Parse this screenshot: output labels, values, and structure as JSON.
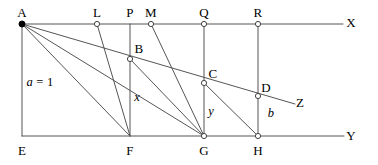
{
  "figure": {
    "stroke_color": "#555555",
    "point_color": "#ffffff",
    "point_stroke": "#444444",
    "text_color": "#000000",
    "width": 378,
    "height": 165
  },
  "axes": {
    "top_line_label": "X",
    "bottom_line_label": "Y",
    "ray_label": "Z"
  },
  "points": [
    {
      "id": "A",
      "label": "A",
      "x": 22,
      "y": 24,
      "marker": "filled",
      "label_x": 22,
      "label_y": 12
    },
    {
      "id": "L",
      "label": "L",
      "x": 97,
      "y": 24,
      "marker": "open",
      "label_x": 97,
      "label_y": 12
    },
    {
      "id": "P",
      "label": "P",
      "x": 130,
      "y": 24,
      "marker": "none",
      "label_x": 130,
      "label_y": 12
    },
    {
      "id": "M",
      "label": "M",
      "x": 151,
      "y": 24,
      "marker": "open",
      "label_x": 151,
      "label_y": 12
    },
    {
      "id": "Q",
      "label": "Q",
      "x": 204,
      "y": 24,
      "marker": "open",
      "label_x": 204,
      "label_y": 12
    },
    {
      "id": "R",
      "label": "R",
      "x": 258,
      "y": 24,
      "marker": "open",
      "label_x": 258,
      "label_y": 12
    },
    {
      "id": "B",
      "label": "B",
      "x": 130,
      "y": 59,
      "marker": "open",
      "label_x": 139,
      "label_y": 48
    },
    {
      "id": "C",
      "label": "C",
      "x": 204,
      "y": 83,
      "marker": "open",
      "label_x": 213,
      "label_y": 73
    },
    {
      "id": "D",
      "label": "D",
      "x": 258,
      "y": 96,
      "marker": "open",
      "label_x": 266,
      "label_y": 87
    },
    {
      "id": "E",
      "label": "E",
      "x": 22,
      "y": 136,
      "marker": "none",
      "label_x": 22,
      "label_y": 150
    },
    {
      "id": "F",
      "label": "F",
      "x": 130,
      "y": 136,
      "marker": "none",
      "label_x": 130,
      "label_y": 150
    },
    {
      "id": "G",
      "label": "G",
      "x": 204,
      "y": 136,
      "marker": "open",
      "label_x": 204,
      "label_y": 150
    },
    {
      "id": "H",
      "label": "H",
      "x": 258,
      "y": 136,
      "marker": "open",
      "label_x": 258,
      "label_y": 150
    }
  ],
  "measures": [
    {
      "id": "a",
      "text": "a = 1",
      "x": 40,
      "y": 82,
      "italic_lead": true
    },
    {
      "id": "x",
      "text": "x",
      "x": 137,
      "y": 97,
      "italic_lead": true
    },
    {
      "id": "y",
      "text": "y",
      "x": 211,
      "y": 111,
      "italic_lead": true
    },
    {
      "id": "b",
      "text": "b",
      "x": 271,
      "y": 113,
      "italic_lead": true
    }
  ],
  "end_labels": [
    {
      "id": "X",
      "text": "X",
      "x": 351,
      "y": 22
    },
    {
      "id": "Y",
      "text": "Y",
      "x": 351,
      "y": 135
    },
    {
      "id": "Z",
      "text": "Z",
      "x": 300,
      "y": 102
    }
  ],
  "segments": [
    {
      "name": "top-line-X",
      "x1": 22,
      "y1": 24,
      "x2": 343,
      "y2": 24
    },
    {
      "name": "bottom-line-Y",
      "x1": 22,
      "y1": 136,
      "x2": 344,
      "y2": 136
    },
    {
      "name": "vertical-AE",
      "x1": 22,
      "y1": 24,
      "x2": 22,
      "y2": 136
    },
    {
      "name": "vertical-PF",
      "x1": 130,
      "y1": 24,
      "x2": 130,
      "y2": 136
    },
    {
      "name": "vertical-QG",
      "x1": 204,
      "y1": 24,
      "x2": 204,
      "y2": 136
    },
    {
      "name": "vertical-RH",
      "x1": 258,
      "y1": 24,
      "x2": 258,
      "y2": 136
    },
    {
      "name": "ray-A-through-BCD-to-Z",
      "x1": 22,
      "y1": 24,
      "x2": 295,
      "y2": 104
    },
    {
      "name": "diagonal-A-to-F",
      "x1": 22,
      "y1": 24,
      "x2": 130,
      "y2": 136
    },
    {
      "name": "diagonal-A-to-G",
      "x1": 22,
      "y1": 24,
      "x2": 204,
      "y2": 136
    },
    {
      "name": "diagonal-L-to-F",
      "x1": 97,
      "y1": 24,
      "x2": 130,
      "y2": 136
    },
    {
      "name": "diagonal-M-to-G",
      "x1": 151,
      "y1": 24,
      "x2": 204,
      "y2": 136
    },
    {
      "name": "diagonal-B-to-G",
      "x1": 130,
      "y1": 59,
      "x2": 204,
      "y2": 136
    },
    {
      "name": "diagonal-C-to-H",
      "x1": 204,
      "y1": 83,
      "x2": 258,
      "y2": 136
    }
  ]
}
